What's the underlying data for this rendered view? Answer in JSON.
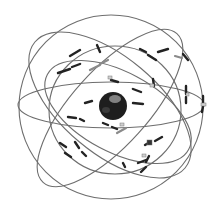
{
  "figure": {
    "alt": "Illustration of Earth surrounded by six elliptical orbital planes with satellites",
    "orbit_planes": 6,
    "colors": {
      "background": "#ffffff",
      "orbit": "#6e6e6e",
      "earth": "#1e1e1e",
      "earth_highlight": "#9a9a9a",
      "satellite": "#222222",
      "satellite_light": "#8a8a8a"
    }
  }
}
